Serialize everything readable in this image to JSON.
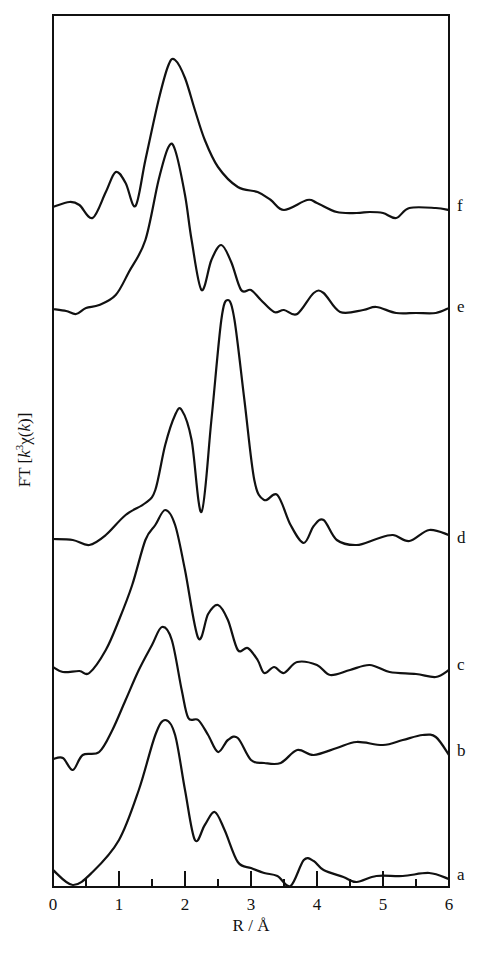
{
  "chart_data": {
    "type": "line",
    "title": "",
    "xlabel": "R / Å",
    "ylabel": "FT [k³χ(k)]",
    "xlim": [
      0,
      6
    ],
    "x_ticks": [
      "0",
      "1",
      "2",
      "3",
      "4",
      "5",
      "6"
    ],
    "minor_ticks_every": 0.5,
    "grid": false,
    "legend": "curve labels at right edge",
    "series": [
      {
        "name": "a",
        "baseline_px": 877,
        "points": [
          [
            0,
            870
          ],
          [
            0.3,
            885
          ],
          [
            0.6,
            872
          ],
          [
            1.0,
            840
          ],
          [
            1.3,
            790
          ],
          [
            1.55,
            735
          ],
          [
            1.7,
            720
          ],
          [
            1.85,
            735
          ],
          [
            2.0,
            790
          ],
          [
            2.15,
            840
          ],
          [
            2.3,
            825
          ],
          [
            2.45,
            812
          ],
          [
            2.6,
            830
          ],
          [
            2.8,
            862
          ],
          [
            3.0,
            868
          ],
          [
            3.2,
            873
          ],
          [
            3.4,
            876
          ],
          [
            3.6,
            886
          ],
          [
            3.8,
            860
          ],
          [
            3.95,
            861
          ],
          [
            4.1,
            870
          ],
          [
            4.4,
            877
          ],
          [
            4.6,
            882
          ],
          [
            4.9,
            876
          ],
          [
            5.3,
            876
          ],
          [
            5.7,
            873
          ],
          [
            6.0,
            879
          ]
        ]
      },
      {
        "name": "b",
        "baseline_px": 753,
        "points": [
          [
            0,
            759
          ],
          [
            0.15,
            758
          ],
          [
            0.3,
            770
          ],
          [
            0.45,
            755
          ],
          [
            0.7,
            752
          ],
          [
            0.9,
            730
          ],
          [
            1.1,
            700
          ],
          [
            1.3,
            670
          ],
          [
            1.5,
            645
          ],
          [
            1.65,
            627
          ],
          [
            1.8,
            640
          ],
          [
            1.95,
            690
          ],
          [
            2.05,
            718
          ],
          [
            2.2,
            720
          ],
          [
            2.35,
            735
          ],
          [
            2.5,
            752
          ],
          [
            2.65,
            740
          ],
          [
            2.8,
            738
          ],
          [
            3.0,
            760
          ],
          [
            3.2,
            763
          ],
          [
            3.45,
            763
          ],
          [
            3.7,
            750
          ],
          [
            3.95,
            755
          ],
          [
            4.3,
            748
          ],
          [
            4.6,
            742
          ],
          [
            5.0,
            745
          ],
          [
            5.3,
            740
          ],
          [
            5.6,
            735
          ],
          [
            5.8,
            737
          ],
          [
            6.0,
            755
          ]
        ]
      },
      {
        "name": "c",
        "baseline_px": 667,
        "points": [
          [
            0,
            667
          ],
          [
            0.15,
            672
          ],
          [
            0.4,
            671
          ],
          [
            0.55,
            673
          ],
          [
            0.8,
            650
          ],
          [
            1.0,
            620
          ],
          [
            1.2,
            585
          ],
          [
            1.4,
            540
          ],
          [
            1.55,
            525
          ],
          [
            1.7,
            510
          ],
          [
            1.85,
            525
          ],
          [
            2.0,
            570
          ],
          [
            2.2,
            638
          ],
          [
            2.35,
            614
          ],
          [
            2.5,
            605
          ],
          [
            2.65,
            620
          ],
          [
            2.8,
            650
          ],
          [
            2.95,
            648
          ],
          [
            3.1,
            660
          ],
          [
            3.2,
            673
          ],
          [
            3.35,
            667
          ],
          [
            3.5,
            673
          ],
          [
            3.7,
            662
          ],
          [
            4.0,
            665
          ],
          [
            4.2,
            675
          ],
          [
            4.5,
            670
          ],
          [
            4.8,
            665
          ],
          [
            5.1,
            672
          ],
          [
            5.5,
            674
          ],
          [
            5.8,
            677
          ],
          [
            6.0,
            670
          ]
        ]
      },
      {
        "name": "d",
        "baseline_px": 540,
        "points": [
          [
            0,
            539
          ],
          [
            0.3,
            540
          ],
          [
            0.55,
            545
          ],
          [
            0.8,
            535
          ],
          [
            1.1,
            515
          ],
          [
            1.4,
            503
          ],
          [
            1.55,
            490
          ],
          [
            1.7,
            445
          ],
          [
            1.85,
            415
          ],
          [
            1.95,
            410
          ],
          [
            2.1,
            440
          ],
          [
            2.25,
            512
          ],
          [
            2.4,
            420
          ],
          [
            2.55,
            320
          ],
          [
            2.65,
            300
          ],
          [
            2.75,
            320
          ],
          [
            2.9,
            400
          ],
          [
            3.05,
            480
          ],
          [
            3.2,
            500
          ],
          [
            3.4,
            495
          ],
          [
            3.6,
            525
          ],
          [
            3.8,
            543
          ],
          [
            3.95,
            526
          ],
          [
            4.1,
            520
          ],
          [
            4.3,
            540
          ],
          [
            4.6,
            545
          ],
          [
            4.9,
            539
          ],
          [
            5.15,
            535
          ],
          [
            5.4,
            541
          ],
          [
            5.7,
            530
          ],
          [
            6.0,
            535
          ]
        ]
      },
      {
        "name": "e",
        "baseline_px": 309,
        "points": [
          [
            0,
            309
          ],
          [
            0.2,
            311
          ],
          [
            0.35,
            314
          ],
          [
            0.5,
            308
          ],
          [
            0.7,
            305
          ],
          [
            0.95,
            295
          ],
          [
            1.15,
            272
          ],
          [
            1.4,
            240
          ],
          [
            1.6,
            180
          ],
          [
            1.75,
            147
          ],
          [
            1.85,
            150
          ],
          [
            2.0,
            195
          ],
          [
            2.1,
            240
          ],
          [
            2.25,
            290
          ],
          [
            2.4,
            260
          ],
          [
            2.55,
            245
          ],
          [
            2.7,
            262
          ],
          [
            2.85,
            290
          ],
          [
            3.0,
            290
          ],
          [
            3.15,
            300
          ],
          [
            3.35,
            312
          ],
          [
            3.5,
            310
          ],
          [
            3.7,
            314
          ],
          [
            3.95,
            293
          ],
          [
            4.1,
            293
          ],
          [
            4.35,
            312
          ],
          [
            4.7,
            310
          ],
          [
            4.9,
            307
          ],
          [
            5.2,
            313
          ],
          [
            5.5,
            313
          ],
          [
            5.8,
            313
          ],
          [
            6.0,
            308
          ]
        ]
      },
      {
        "name": "f",
        "baseline_px": 208,
        "points": [
          [
            0,
            207
          ],
          [
            0.25,
            202
          ],
          [
            0.4,
            205
          ],
          [
            0.6,
            218
          ],
          [
            0.8,
            192
          ],
          [
            0.95,
            172
          ],
          [
            1.1,
            183
          ],
          [
            1.25,
            206
          ],
          [
            1.4,
            160
          ],
          [
            1.6,
            100
          ],
          [
            1.75,
            65
          ],
          [
            1.85,
            60
          ],
          [
            2.0,
            78
          ],
          [
            2.15,
            110
          ],
          [
            2.3,
            140
          ],
          [
            2.5,
            167
          ],
          [
            2.8,
            187
          ],
          [
            3.1,
            192
          ],
          [
            3.3,
            200
          ],
          [
            3.5,
            210
          ],
          [
            3.85,
            200
          ],
          [
            4.0,
            203
          ],
          [
            4.3,
            212
          ],
          [
            4.6,
            213
          ],
          [
            4.8,
            212
          ],
          [
            5.0,
            213
          ],
          [
            5.2,
            218
          ],
          [
            5.4,
            208
          ],
          [
            5.8,
            208
          ],
          [
            6.0,
            210
          ]
        ]
      }
    ]
  },
  "axes": {
    "xlabel": "R / Å",
    "ylabel": "FT [k³χ(k)]",
    "x_tick_labels": [
      "0",
      "1",
      "2",
      "3",
      "4",
      "5",
      "6"
    ]
  },
  "curve_labels": [
    "f",
    "e",
    "d",
    "c",
    "b",
    "a"
  ]
}
